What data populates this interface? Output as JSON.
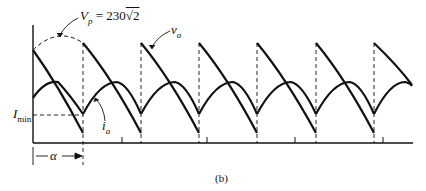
{
  "figure": {
    "caption": "(b)",
    "labels": {
      "vp_symbol": "V",
      "vp_sub": "p",
      "vp_value": " = 230",
      "vp_sqrt": "√2",
      "va_symbol": "v",
      "va_sub": "a",
      "imin_symbol": "I",
      "imin_sub": "min",
      "ia_symbol": "i",
      "ia_sub": "a",
      "alpha": "α"
    },
    "colors": {
      "line": "#111111",
      "background": "#ffffff"
    },
    "waveforms": {
      "periods": 6,
      "period_px": 58,
      "first_dashed_x": 83,
      "dashed_x": [
        141,
        199,
        257,
        316,
        374
      ],
      "tick_x": [
        122,
        207,
        295,
        383
      ]
    }
  }
}
